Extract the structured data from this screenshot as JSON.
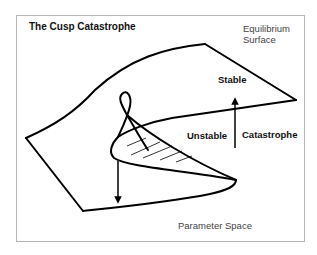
{
  "diagram": {
    "title": "The Cusp Catastrophe",
    "labels": {
      "equilibrium_surface": "Equilibrium Surface",
      "stable": "Stable",
      "unstable": "Unstable",
      "catastrophe": "Catastrophe",
      "parameter_space": "Parameter Space"
    },
    "elements": {
      "surface": "folded equilibrium surface with cusp",
      "hatched_region": "unstable middle sheet (hatched)",
      "arrow_up": "upward catastrophe jump arrow",
      "arrow_down": "downward catastrophe jump arrow"
    },
    "colors": {
      "stroke": "#000000",
      "frame": "#b5b5b5",
      "text": "#222222"
    }
  }
}
